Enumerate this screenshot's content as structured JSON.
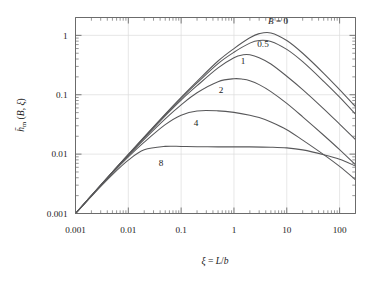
{
  "chart_data": {
    "type": "line",
    "title": "",
    "xlabel": "ξ = L/b",
    "ylabel": "h̄m (B, ξ)",
    "xscale": "log",
    "yscale": "log",
    "xlim": [
      0.001,
      200
    ],
    "ylim": [
      0.001,
      2
    ],
    "grid": true,
    "x_ticks": [
      0.001,
      0.01,
      0.1,
      1,
      10,
      100
    ],
    "x_tick_labels": [
      "0.001",
      "0.01",
      "0.1",
      "1",
      "10",
      "100"
    ],
    "y_ticks": [
      0.001,
      0.01,
      0.1,
      1
    ],
    "y_tick_labels": [
      "0.001",
      "0.01",
      "0.1",
      "1"
    ],
    "legend_position": "inline-labels",
    "legend_prefix": "B =",
    "series": [
      {
        "name": "B = 0",
        "label": "B = 0",
        "B": 0,
        "x": [
          0.001,
          0.002,
          0.005,
          0.01,
          0.02,
          0.05,
          0.1,
          0.2,
          0.5,
          1,
          2,
          3,
          5,
          10,
          20,
          50,
          100,
          200
        ],
        "y": [
          0.001,
          0.002,
          0.005,
          0.0099,
          0.0195,
          0.0473,
          0.0905,
          0.168,
          0.37,
          0.6,
          0.91,
          1.07,
          1.1,
          0.82,
          0.5,
          0.23,
          0.122,
          0.063
        ]
      },
      {
        "name": "B = 0.5",
        "label": "0.5",
        "B": 0.5,
        "x": [
          0.001,
          0.002,
          0.005,
          0.01,
          0.02,
          0.05,
          0.1,
          0.2,
          0.5,
          1,
          2,
          3,
          5,
          10,
          20,
          50,
          100,
          200
        ],
        "y": [
          0.001,
          0.002,
          0.005,
          0.0098,
          0.0192,
          0.0462,
          0.0872,
          0.158,
          0.335,
          0.52,
          0.74,
          0.82,
          0.79,
          0.58,
          0.36,
          0.168,
          0.091,
          0.047
        ]
      },
      {
        "name": "B = 1",
        "label": "1",
        "B": 1,
        "x": [
          0.001,
          0.002,
          0.005,
          0.01,
          0.02,
          0.05,
          0.1,
          0.2,
          0.5,
          1,
          1.5,
          2,
          3,
          5,
          10,
          20,
          50,
          100,
          200
        ],
        "y": [
          0.001,
          0.002,
          0.005,
          0.0097,
          0.0188,
          0.0442,
          0.0815,
          0.142,
          0.283,
          0.42,
          0.47,
          0.47,
          0.42,
          0.33,
          0.205,
          0.122,
          0.058,
          0.032,
          0.0175
        ]
      },
      {
        "name": "B = 2",
        "label": "2",
        "B": 2,
        "x": [
          0.001,
          0.002,
          0.005,
          0.01,
          0.02,
          0.05,
          0.1,
          0.2,
          0.5,
          1,
          1.5,
          2,
          3,
          5,
          10,
          20,
          50,
          100,
          200
        ],
        "y": [
          0.001,
          0.002,
          0.00495,
          0.0095,
          0.0178,
          0.0393,
          0.0676,
          0.108,
          0.166,
          0.186,
          0.182,
          0.172,
          0.148,
          0.113,
          0.0715,
          0.0425,
          0.0208,
          0.0119,
          0.0066
        ]
      },
      {
        "name": "B = 4",
        "label": "4",
        "B": 4,
        "x": [
          0.001,
          0.002,
          0.005,
          0.01,
          0.02,
          0.05,
          0.1,
          0.2,
          0.5,
          1,
          2,
          3,
          5,
          10,
          20,
          50,
          100,
          200
        ],
        "y": [
          0.001,
          0.00198,
          0.0048,
          0.009,
          0.0159,
          0.0313,
          0.0452,
          0.0533,
          0.0535,
          0.0505,
          0.0452,
          0.0412,
          0.0348,
          0.0258,
          0.0172,
          0.0098,
          0.0062,
          0.0037
        ]
      },
      {
        "name": "B = 8",
        "label": "8",
        "B": 8,
        "x": [
          0.001,
          0.002,
          0.005,
          0.01,
          0.02,
          0.05,
          0.1,
          0.2,
          0.5,
          1,
          2,
          5,
          10,
          20,
          50,
          100,
          200
        ],
        "y": [
          0.001,
          0.00195,
          0.0045,
          0.0079,
          0.0118,
          0.0135,
          0.01345,
          0.01335,
          0.01325,
          0.01325,
          0.01325,
          0.0131,
          0.01275,
          0.0118,
          0.0098,
          0.0082,
          0.0063
        ]
      }
    ],
    "annotations": [
      {
        "text": "B = 0",
        "x_px": 278,
        "y_px": 24
      },
      {
        "text": "0.5",
        "x_px": 263,
        "y_px": 47
      },
      {
        "text": "1",
        "x_px": 243,
        "y_px": 64
      },
      {
        "text": "2",
        "x_px": 221,
        "y_px": 93
      },
      {
        "text": "4",
        "x_px": 196,
        "y_px": 126
      },
      {
        "text": "8",
        "x_px": 161,
        "y_px": 166
      }
    ]
  },
  "axes": {
    "x_title_xi": "ξ",
    "x_title_eq": "=",
    "x_title_L": "L",
    "x_title_slash": "/",
    "x_title_b": "b",
    "y_title_h": "h",
    "y_title_sub": "m",
    "y_title_rest": "(B, ξ)"
  },
  "tick_labels": {
    "x": [
      "0.001",
      "0.01",
      "0.1",
      "1",
      "10",
      "100"
    ],
    "y": [
      "1",
      "0.1",
      "0.01",
      "0.001"
    ]
  },
  "colors": {
    "curve": "#58585a",
    "axis": "#6b6b6b",
    "grid": "#dcdcdc",
    "text": "#1a1a1a",
    "background": "#ffffff"
  }
}
